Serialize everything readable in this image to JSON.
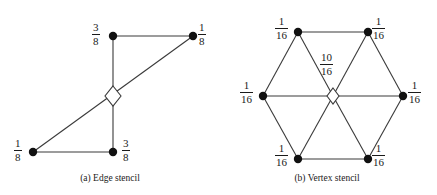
{
  "figure": {
    "background_color": "#ffffff",
    "stroke_color": "#3a3a3a",
    "node_fill_color": "#111111",
    "text_color": "#1a1a1a"
  },
  "panels": [
    {
      "id": "edge-stencil",
      "caption": "(a) Edge stencil",
      "center_marker": "open-diamond",
      "nodes": [
        {
          "name": "top-left",
          "label_num": "3",
          "label_den": "8",
          "label": "3/8",
          "cx": 113,
          "cy": 36,
          "label_x": 92,
          "label_y": 22
        },
        {
          "name": "top-right",
          "label_num": "1",
          "label_den": "8",
          "label": "1/8",
          "cx": 193,
          "cy": 36,
          "label_x": 198,
          "label_y": 22
        },
        {
          "name": "bottom-left",
          "label_num": "1",
          "label_den": "8",
          "label": "1/8",
          "cx": 33,
          "cy": 152,
          "label_x": 14,
          "label_y": 138
        },
        {
          "name": "bottom-right",
          "label_num": "3",
          "label_den": "8",
          "label": "3/8",
          "cx": 113,
          "cy": 152,
          "label_x": 122,
          "label_y": 138
        }
      ],
      "center": {
        "cx": 113,
        "cy": 96
      },
      "edges": [
        {
          "from": "top-left",
          "to": "top-right"
        },
        {
          "from": "top-left",
          "to": "bottom-right"
        },
        {
          "from": "bottom-left",
          "to": "bottom-right"
        },
        {
          "from": "bottom-left",
          "to": "top-right"
        }
      ]
    },
    {
      "id": "vertex-stencil",
      "caption": "(b) Vertex stencil",
      "center_marker": "open-diamond",
      "center_label_num": "10",
      "center_label_den": "16",
      "center_label": "10/16",
      "nodes": [
        {
          "name": "top-left",
          "label_num": "1",
          "label_den": "16",
          "label": "1/16",
          "cx": 298,
          "cy": 32,
          "label_x": 277,
          "label_y": 18
        },
        {
          "name": "top-right",
          "label_num": "1",
          "label_den": "16",
          "label": "1/16",
          "cx": 368,
          "cy": 32,
          "label_x": 372,
          "label_y": 18
        },
        {
          "name": "left",
          "label_num": "1",
          "label_den": "16",
          "label": "1/16",
          "cx": 263,
          "cy": 96,
          "label_x": 242,
          "label_y": 82
        },
        {
          "name": "right",
          "label_num": "1",
          "label_den": "16",
          "label": "1/16",
          "cx": 403,
          "cy": 96,
          "label_x": 408,
          "label_y": 82
        },
        {
          "name": "bottom-left",
          "label_num": "1",
          "label_den": "16",
          "label": "1/16",
          "cx": 298,
          "cy": 159,
          "label_x": 277,
          "label_y": 145
        },
        {
          "name": "bottom-right",
          "label_num": "1",
          "label_den": "16",
          "label": "1/16",
          "cx": 368,
          "cy": 159,
          "label_x": 372,
          "label_y": 145
        }
      ],
      "center": {
        "cx": 333,
        "cy": 96,
        "label_x": 322,
        "label_y": 52
      },
      "edges": [
        {
          "from": "top-left",
          "to": "top-right"
        },
        {
          "from": "top-right",
          "to": "right"
        },
        {
          "from": "right",
          "to": "bottom-right"
        },
        {
          "from": "bottom-right",
          "to": "bottom-left"
        },
        {
          "from": "bottom-left",
          "to": "left"
        },
        {
          "from": "left",
          "to": "top-left"
        },
        {
          "from": "center",
          "to": "top-left"
        },
        {
          "from": "center",
          "to": "top-right"
        },
        {
          "from": "center",
          "to": "left"
        },
        {
          "from": "center",
          "to": "right"
        },
        {
          "from": "center",
          "to": "bottom-left"
        },
        {
          "from": "center",
          "to": "bottom-right"
        }
      ]
    }
  ]
}
